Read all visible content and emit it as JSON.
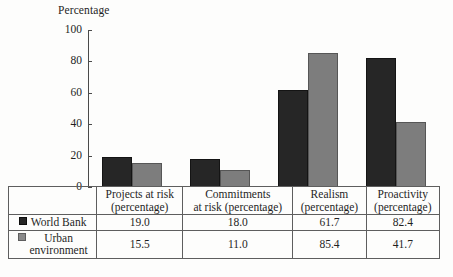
{
  "chart_data": {
    "type": "bar",
    "title": "",
    "ylabel": "Percentage",
    "xlabel": "",
    "ylim": [
      0,
      100
    ],
    "yticks": [
      "0",
      "20",
      "40",
      "60",
      "80",
      "100"
    ],
    "grid": false,
    "legend_position": "table-left",
    "categories": [
      "Projects at risk (percentage)",
      "Commitments at risk (percentage)",
      "Realism (percentage)",
      "Proactivity (percentage)"
    ],
    "series": [
      {
        "name": "World Bank",
        "color": "#262626",
        "values": [
          19.0,
          18.0,
          61.7,
          82.4
        ]
      },
      {
        "name": "Urban environment",
        "color": "#7d7d7d",
        "values": [
          15.5,
          11.0,
          85.4,
          41.7
        ]
      }
    ]
  },
  "chart": {
    "axis_title": "Percentage",
    "y_ticks": [
      {
        "label": "100",
        "value": 100
      },
      {
        "label": "80",
        "value": 80
      },
      {
        "label": "60",
        "value": 60
      },
      {
        "label": "40",
        "value": 40
      },
      {
        "label": "20",
        "value": 20
      },
      {
        "label": "0",
        "value": 0
      }
    ]
  },
  "table": {
    "column_headers": [
      {
        "line1": "Projects at risk",
        "line2": "(percentage)"
      },
      {
        "line1": "Commitments",
        "line2": "at risk (percentage)"
      },
      {
        "line1": "Realism",
        "line2": "(percentage)"
      },
      {
        "line1": "Proactivity",
        "line2": "(percentage)"
      }
    ],
    "rows": [
      {
        "label_line1": "World Bank",
        "label_line2": "",
        "swatch": "dark-square-swatch",
        "values": [
          "19.0",
          "18.0",
          "61.7",
          "82.4"
        ]
      },
      {
        "label_line1": "Urban",
        "label_line2": "environment",
        "swatch": "gray-square-swatch",
        "values": [
          "15.5",
          "11.0",
          "85.4",
          "41.7"
        ]
      }
    ]
  }
}
